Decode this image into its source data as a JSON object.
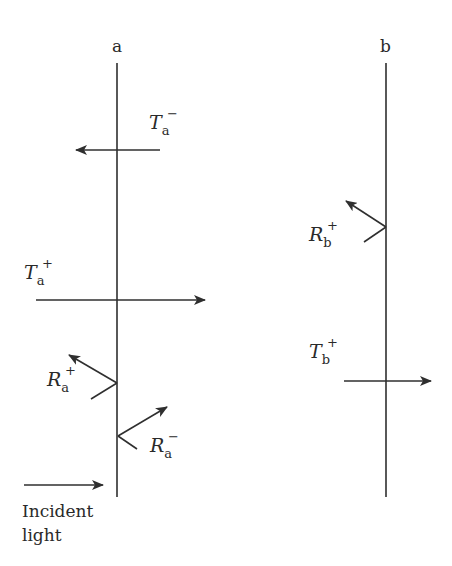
{
  "diagram": {
    "colors": {
      "line": "#2f2f2f",
      "text": "#2a2a2a",
      "background": "#ffffff"
    },
    "interfaces": [
      {
        "id": "a",
        "label": "a",
        "x": 117,
        "y_top": 63,
        "y_bottom": 497
      },
      {
        "id": "b",
        "label": "b",
        "x": 386,
        "y_top": 63,
        "y_bottom": 497
      }
    ],
    "labels": {
      "Ta_minus": {
        "symbol": "T",
        "sub": "a",
        "sup": "−"
      },
      "Ta_plus": {
        "symbol": "T",
        "sub": "a",
        "sup": "+"
      },
      "Ra_plus": {
        "symbol": "R",
        "sub": "a",
        "sup": "+"
      },
      "Ra_minus": {
        "symbol": "R",
        "sub": "a",
        "sup": "−"
      },
      "Rb_plus": {
        "symbol": "R",
        "sub": "b",
        "sup": "+"
      },
      "Tb_plus": {
        "symbol": "T",
        "sub": "b",
        "sup": "+"
      }
    },
    "incident": {
      "line1": "Incident",
      "line2": "light"
    },
    "arrows": [
      {
        "name": "Ta-minus",
        "from": [
          160,
          150
        ],
        "to": [
          76,
          150
        ]
      },
      {
        "name": "Ta-plus",
        "from": [
          36,
          300
        ],
        "to": [
          205,
          300
        ]
      },
      {
        "name": "Ra-plus",
        "from": [
          117,
          383
        ],
        "to": [
          69,
          355
        ],
        "incoming_from": [
          91,
          399
        ]
      },
      {
        "name": "Ra-minus",
        "from": [
          118,
          436
        ],
        "to": [
          167,
          407
        ],
        "incoming_from": [
          137,
          449
        ]
      },
      {
        "name": "Rb-plus",
        "from": [
          386,
          227
        ],
        "to": [
          346,
          201
        ],
        "incoming_from": [
          364,
          242
        ]
      },
      {
        "name": "Tb-plus",
        "from": [
          344,
          381
        ],
        "to": [
          431,
          381
        ]
      },
      {
        "name": "incident-light",
        "from": [
          24,
          485
        ],
        "to": [
          103,
          485
        ]
      }
    ]
  }
}
